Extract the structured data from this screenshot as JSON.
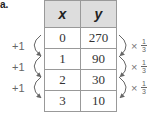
{
  "problem_label": "a.",
  "table": {
    "headers": [
      "x",
      "y"
    ],
    "rows": [
      {
        "x": "0",
        "y": "270"
      },
      {
        "x": "1",
        "y": "90"
      },
      {
        "x": "2",
        "y": "30"
      },
      {
        "x": "3",
        "y": "10"
      }
    ]
  },
  "left_annotations": [
    "+1",
    "+1",
    "+1"
  ],
  "right_annotations": [
    {
      "symbol": "×",
      "numerator": "1",
      "denominator": "3"
    },
    {
      "symbol": "×",
      "numerator": "1",
      "denominator": "3"
    },
    {
      "symbol": "×",
      "numerator": "1",
      "denominator": "3"
    }
  ],
  "colors": {
    "header_bg": "#dddddd",
    "border": "#999999",
    "annotation": "#666666"
  }
}
